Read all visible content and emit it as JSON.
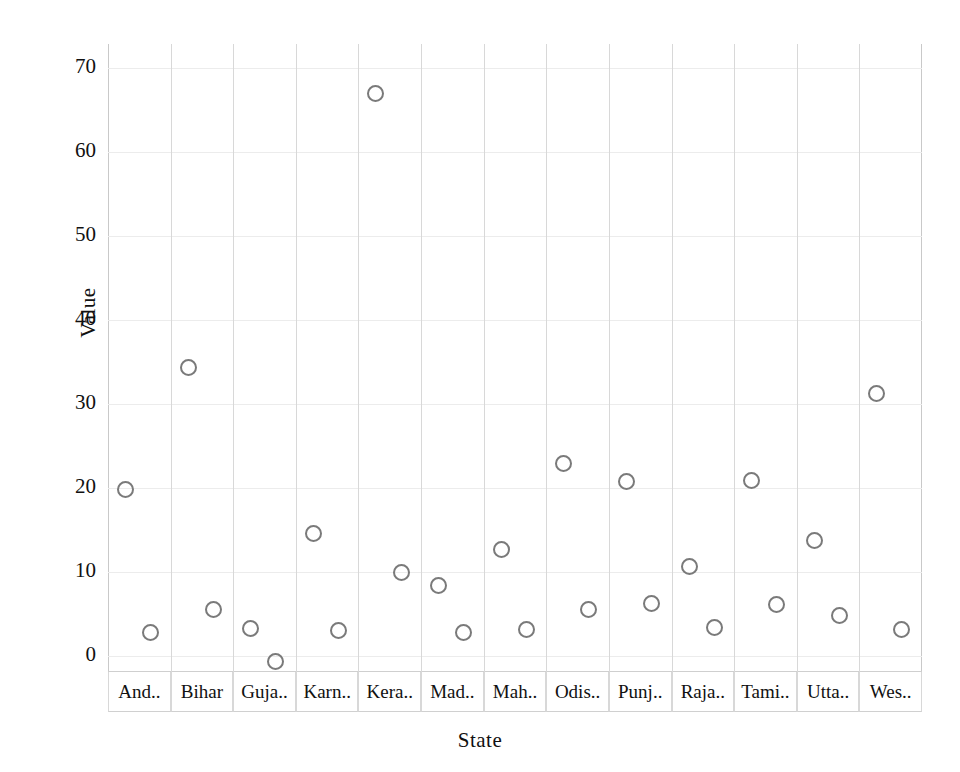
{
  "chart_data": {
    "type": "scatter",
    "title": "",
    "xlabel": "State",
    "ylabel": "Value",
    "ylim": [
      -3,
      72
    ],
    "yticks": [
      0,
      10,
      20,
      30,
      40,
      50,
      60,
      70
    ],
    "grid": "vertical panel separators, faint horizontal gridlines",
    "legend": "none",
    "panel_layout": "one panel strip per state, two points plotted within each panel",
    "categories": [
      "And..",
      "Bihar",
      "Guja..",
      "Karn..",
      "Kera..",
      "Mad..",
      "Mah..",
      "Odis..",
      "Punj..",
      "Raja..",
      "Tami..",
      "Utta..",
      "Wes.."
    ],
    "series": [
      {
        "name": "point-1",
        "values": [
          19.8,
          34.3,
          3.3,
          14.6,
          67.0,
          8.4,
          12.7,
          22.9,
          20.8,
          10.7,
          20.9,
          13.8,
          31.3
        ]
      },
      {
        "name": "point-2",
        "values": [
          2.8,
          5.5,
          -0.7,
          3.0,
          9.9,
          2.8,
          3.1,
          5.5,
          6.2,
          3.4,
          6.1,
          4.8,
          3.1
        ]
      }
    ],
    "marker": {
      "shape": "open-circle",
      "edge_color": "#7a7a7a",
      "fill": "none",
      "size_px": 17
    }
  },
  "axes": {
    "y_title": "Value",
    "x_title": "State",
    "y_tick_labels": [
      "70",
      "60",
      "50",
      "40",
      "30",
      "20",
      "10",
      "0"
    ]
  }
}
